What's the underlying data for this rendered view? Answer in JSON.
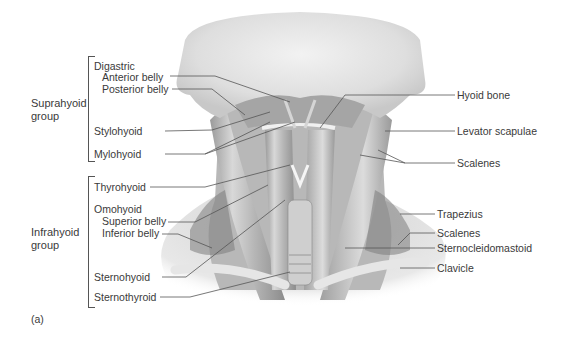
{
  "figure": {
    "panel_label": "(a)"
  },
  "groups": [
    {
      "name": "Suprahyoid",
      "label_line1": "Suprahyoid",
      "label_line2": "group"
    },
    {
      "name": "Infrahyoid",
      "label_line1": "Infrahyoid",
      "label_line2": "group"
    }
  ],
  "left_labels": {
    "digastric": "Digastric",
    "anterior_belly": "Anterior belly",
    "posterior_belly": "Posterior belly",
    "stylohyoid": "Stylohyoid",
    "mylohyoid": "Mylohyoid",
    "thyrohyoid": "Thyrohyoid",
    "omohyoid": "Omohyoid",
    "superior_belly": "Superior belly",
    "inferior_belly": "Inferior belly",
    "sternohyoid": "Sternohyoid",
    "sternothyroid": "Sternothyroid"
  },
  "right_labels": {
    "hyoid_bone": "Hyoid bone",
    "levator_scapulae": "Levator scapulae",
    "scalenes_upper": "Scalenes",
    "trapezius": "Trapezius",
    "scalenes_lower": "Scalenes",
    "sternocleidomastoid": "Sternocleidomastoid",
    "clavicle": "Clavicle"
  }
}
